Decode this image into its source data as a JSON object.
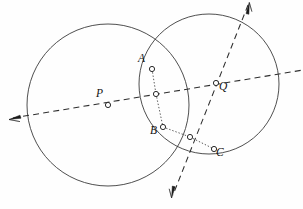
{
  "figure": {
    "background_color": "#fefefe",
    "stroke_color": "#3b3b3b",
    "width": 303,
    "height": 209
  },
  "chart_data": {
    "type": "diagram",
    "subtype": "euclidean-geometry-construction",
    "xlabel": "",
    "ylabel": "",
    "xlim": [
      0,
      303
    ],
    "ylim": [
      209,
      0
    ],
    "grid": false,
    "legend": false,
    "circles": [
      {
        "name": "circle-P",
        "center_label": "P",
        "cx": 108,
        "cy": 105,
        "r": 81,
        "style": "solid"
      },
      {
        "name": "circle-Q",
        "center_label": "Q",
        "cx": 209,
        "cy": 84,
        "r": 70,
        "style": "solid"
      }
    ],
    "points": [
      {
        "label": "P",
        "x": 108,
        "y": 105,
        "marker": "open-circle",
        "label_dx": -12,
        "label_dy": -12
      },
      {
        "label": "Q",
        "x": 216,
        "y": 83,
        "marker": "open-circle",
        "label_dx": 3,
        "label_dy": 3
      },
      {
        "label": "A",
        "x": 152,
        "y": 69,
        "marker": "open-circle",
        "label_dx": -14,
        "label_dy": -11
      },
      {
        "label": "B",
        "x": 163,
        "y": 127,
        "marker": "open-circle",
        "label_dx": -13,
        "label_dy": 3
      },
      {
        "label": "C",
        "x": 214,
        "y": 149,
        "marker": "open-circle",
        "label_dx": 2,
        "label_dy": 3
      },
      {
        "label": "",
        "x": 156,
        "y": 94,
        "marker": "open-circle",
        "label_dx": 0,
        "label_dy": 0
      },
      {
        "label": "",
        "x": 190,
        "y": 137,
        "marker": "open-circle",
        "label_dx": 0,
        "label_dy": 0
      }
    ],
    "lines": [
      {
        "name": "center-line-PQ",
        "style": "dashed",
        "x1": 13,
        "y1": 118,
        "x2": 303,
        "y2": 70,
        "arrow_start": true,
        "arrow_end": false
      },
      {
        "name": "transversal-line",
        "style": "dashed",
        "x1": 248,
        "y1": 5,
        "x2": 173,
        "y2": 195,
        "arrow_start": true,
        "arrow_end": true
      },
      {
        "name": "chord-A-to-M",
        "style": "dotted",
        "x1": 152,
        "y1": 69,
        "x2": 156,
        "y2": 94
      },
      {
        "name": "chord-M-to-B",
        "style": "dotted",
        "x1": 156,
        "y1": 94,
        "x2": 163,
        "y2": 127
      },
      {
        "name": "chord-B-to-N",
        "style": "dotted",
        "x1": 163,
        "y1": 127,
        "x2": 190,
        "y2": 137
      },
      {
        "name": "chord-N-to-C",
        "style": "dotted",
        "x1": 190,
        "y1": 137,
        "x2": 214,
        "y2": 149
      }
    ],
    "labels": {
      "P": "P",
      "Q": "Q",
      "A": "A",
      "B": "B",
      "C": "C"
    }
  },
  "caption": {
    "text": ""
  }
}
